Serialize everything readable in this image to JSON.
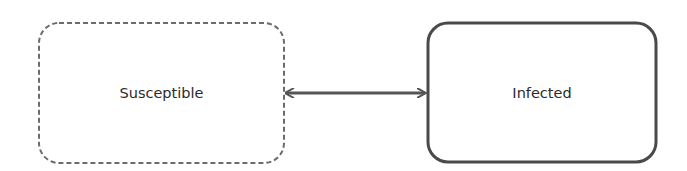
{
  "diagram": {
    "nodes": [
      {
        "id": "susceptible",
        "label": "Susceptible",
        "border_style": "dashed",
        "border_color": "#6b6b6b"
      },
      {
        "id": "infected",
        "label": "Infected",
        "border_style": "solid",
        "border_color": "#4a4a4a"
      }
    ],
    "edges": [
      {
        "from": "susceptible",
        "to": "infected",
        "direction": "bidirectional",
        "color": "#555555"
      }
    ]
  }
}
